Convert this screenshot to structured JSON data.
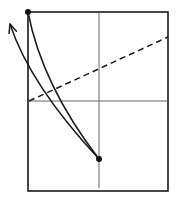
{
  "diagram": {
    "width": 180,
    "height": 201,
    "stroke_color": "#1a1a1a",
    "axis_color": "#555555",
    "frame": {
      "x": 28,
      "y": 12,
      "w": 140,
      "h": 179
    },
    "vertical_axis": {
      "x": 99,
      "y1": 12,
      "y2": 188
    },
    "horizontal_axis": {
      "y": 101,
      "x1": 28,
      "x2": 168
    },
    "dashed_line": {
      "x1": 29,
      "y1": 101,
      "x2": 168,
      "y2": 37
    },
    "points": [
      {
        "name": "start-point",
        "x": 28,
        "y": 12
      },
      {
        "name": "end-point",
        "x": 99,
        "y": 159
      }
    ],
    "curves": [
      {
        "name": "inner-curve",
        "path": "M28,12 Q42,85 99,159"
      },
      {
        "name": "arrow-curve",
        "path": "M99,159 Q30,85 10,24"
      }
    ],
    "arrowhead": {
      "tip_x": 10,
      "tip_y": 24
    }
  }
}
